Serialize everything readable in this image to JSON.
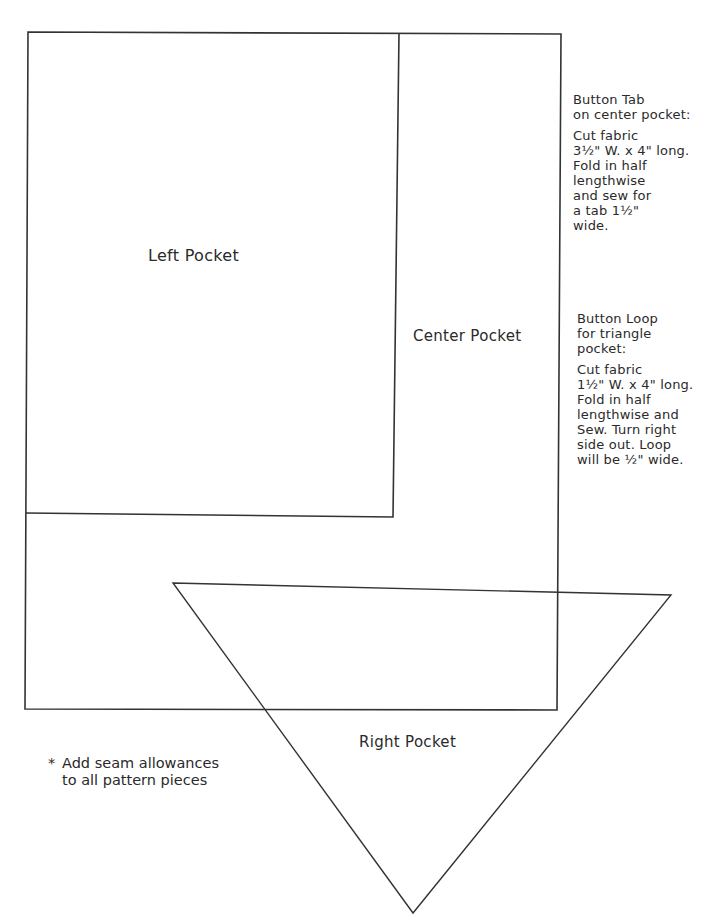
{
  "diagram": {
    "type": "sewing-pattern",
    "stroke_color": "#333333",
    "pieces": [
      {
        "id": "outer",
        "shape": "polygon",
        "points": [
          [
            28,
            32
          ],
          [
            561,
            34
          ],
          [
            557,
            710
          ],
          [
            25,
            709
          ]
        ]
      },
      {
        "id": "left-pocket",
        "label": "Left Pocket",
        "shape": "polyline",
        "points": [
          [
            399,
            33
          ],
          [
            393,
            517
          ],
          [
            26,
            513
          ]
        ]
      },
      {
        "id": "right-pocket",
        "label": "Right Pocket",
        "shape": "triangle",
        "points": [
          [
            173,
            583
          ],
          [
            671,
            595
          ],
          [
            413,
            913
          ]
        ]
      }
    ]
  },
  "labels": {
    "left_pocket": "Left Pocket",
    "center_pocket": "Center Pocket",
    "right_pocket": "Right Pocket"
  },
  "notes": {
    "button_tab": {
      "heading": [
        "Button Tab",
        "on center pocket:"
      ],
      "body": [
        "Cut fabric",
        "3½\" W. x 4\" long.",
        "Fold in half",
        "lengthwise",
        "and sew for",
        "a tab 1½\"",
        "wide."
      ]
    },
    "button_loop": {
      "heading": [
        "Button Loop",
        "for triangle",
        "pocket:"
      ],
      "body": [
        "Cut fabric",
        "1½\" W. x 4\" long.",
        "Fold in half",
        "lengthwise and",
        "Sew. Turn right",
        "side out. Loop",
        "will be ½\" wide."
      ]
    }
  },
  "footnote": {
    "symbol": "*",
    "lines": [
      "Add seam allowances",
      "to all pattern pieces"
    ]
  }
}
